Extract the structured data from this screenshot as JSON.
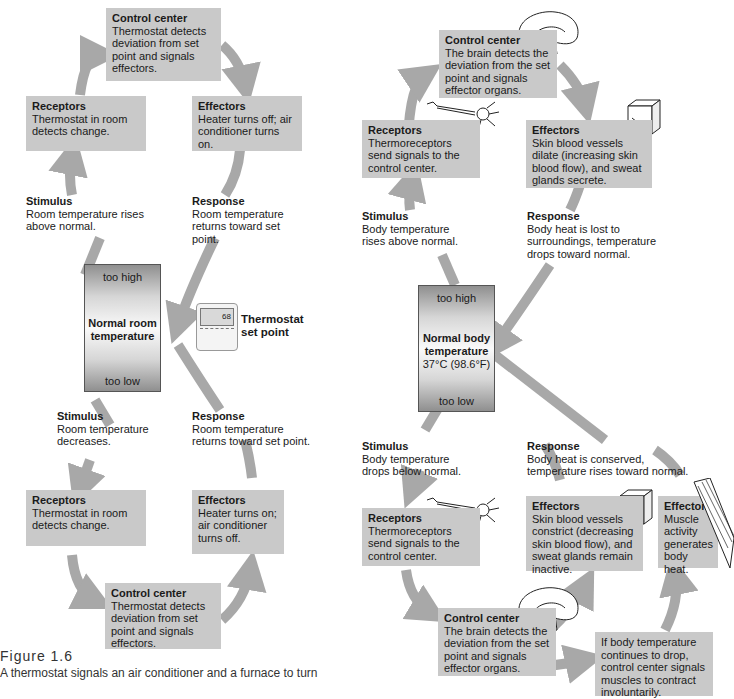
{
  "left_loop": {
    "top": {
      "control_center": {
        "title": "Control center",
        "text": "Thermostat detects deviation from set point and signals effectors."
      },
      "receptors": {
        "title": "Receptors",
        "text": "Thermostat in room detects change."
      },
      "effectors": {
        "title": "Effectors",
        "text": "Heater turns off; air conditioner turns on."
      },
      "stimulus": {
        "title": "Stimulus",
        "text": "Room temperature rises above normal."
      },
      "response": {
        "title": "Response",
        "text": "Room temperature returns toward set point."
      }
    },
    "gauge": {
      "too_high": "too high",
      "label": "Normal room temperature",
      "too_low": "too low"
    },
    "thermostat": {
      "label": "Thermostat set point",
      "display": "68"
    },
    "bottom": {
      "stimulus": {
        "title": "Stimulus",
        "text": "Room temperature decreases."
      },
      "response": {
        "title": "Response",
        "text": "Room temperature returns toward set point."
      },
      "receptors": {
        "title": "Receptors",
        "text": "Thermostat in room detects change."
      },
      "effectors": {
        "title": "Effectors",
        "text": "Heater turns on; air conditioner turns off."
      },
      "control_center": {
        "title": "Control center",
        "text": "Thermostat detects deviation from set point and signals effectors."
      }
    }
  },
  "right_loop": {
    "top": {
      "control_center": {
        "title": "Control center",
        "text": "The brain detects the deviation from the set point and signals effector organs."
      },
      "receptors": {
        "title": "Receptors",
        "text": "Thermoreceptors send signals to the control center."
      },
      "effectors": {
        "title": "Effectors",
        "text": "Skin blood vessels dilate (increasing skin blood flow), and sweat glands secrete."
      },
      "stimulus": {
        "title": "Stimulus",
        "text": "Body temperature rises above normal."
      },
      "response": {
        "title": "Response",
        "text": "Body heat is lost to surroundings, temperature drops toward normal."
      }
    },
    "gauge": {
      "too_high": "too high",
      "label": "Normal body temperature",
      "value": "37°C (98.6°F)",
      "too_low": "too low"
    },
    "bottom": {
      "stimulus": {
        "title": "Stimulus",
        "text": "Body temperature drops below normal."
      },
      "response": {
        "title": "Response",
        "text": "Body heat is conserved, temperature rises toward normal."
      },
      "receptors": {
        "title": "Receptors",
        "text": "Thermoreceptors send signals to the control center."
      },
      "effectors_skin": {
        "title": "Effectors",
        "text": "Skin blood vessels constrict (decreasing skin blood flow), and sweat glands remain inactive."
      },
      "effectors_muscle": {
        "title": "Effectors",
        "text": "Muscle activity generates body heat."
      },
      "control_center": {
        "title": "Control center",
        "text": "The brain detects the deviation from the set point and signals effector organs."
      },
      "shivering": {
        "text": "If body temperature continues to drop, control center signals muscles to contract involuntarily."
      }
    }
  },
  "caption": {
    "title": "Figure 1.6",
    "text": "A thermostat signals an air conditioner and a furnace to turn"
  },
  "colors": {
    "box": "#c9c9c9",
    "arrow": "#a8a8a8"
  }
}
